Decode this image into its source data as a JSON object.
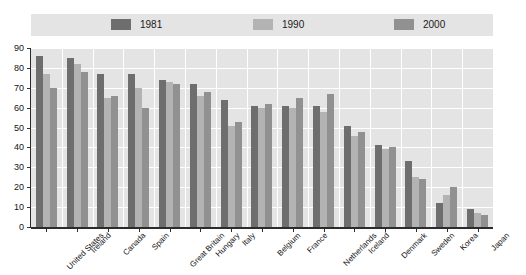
{
  "chart_data": {
    "type": "bar",
    "title": "",
    "subtitle": "",
    "xlabel": "",
    "ylabel": "",
    "ylim": [
      0,
      90
    ],
    "yticks": [
      0,
      10,
      20,
      30,
      40,
      50,
      60,
      70,
      80,
      90
    ],
    "grid": true,
    "legend_position": "top",
    "categories": [
      "United States",
      "Ireland",
      "Canada",
      "Spain",
      "Great Britain",
      "Hungary",
      "Italy",
      "Belgium",
      "France",
      "Netherlands",
      "Iceland",
      "Denmark",
      "Sweden",
      "Korea",
      "Japan"
    ],
    "series": [
      {
        "name": "1981",
        "color": "#6e6e6e",
        "values": [
          86,
          85,
          77,
          77,
          74,
          72,
          64,
          61,
          61,
          61,
          51,
          41,
          33,
          12,
          9
        ]
      },
      {
        "name": "1990",
        "color": "#b3b3b3",
        "values": [
          77,
          82,
          65,
          70,
          73,
          66,
          51,
          60,
          60,
          58,
          46,
          39,
          25,
          16,
          7
        ]
      },
      {
        "name": "2000",
        "color": "#919191",
        "values": [
          70,
          78,
          66,
          60,
          72,
          68,
          53,
          62,
          65,
          67,
          48,
          40,
          24,
          20,
          6
        ]
      }
    ]
  },
  "colors": {
    "plot_background": "#e4e4e4",
    "legend_background": "#e4e4e4",
    "gridline": "#ffffff",
    "axis": "#2b2b2b",
    "text": "#141414"
  }
}
